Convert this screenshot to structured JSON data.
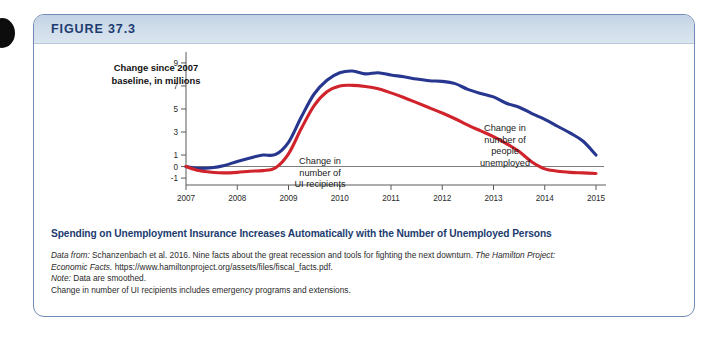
{
  "figure": {
    "label": "FIGURE 37.3",
    "caption": "Spending on Unemployment Insurance Increases Automatically with the Number of Unemployed Persons"
  },
  "notes": {
    "data_from_label": "Data from:",
    "data_from_text": " Schanzenbach et al. 2016. Nine facts about the great recession and tools for fighting the next downturn. ",
    "source_title": "The Hamilton Project:",
    "source_title_2": "Economic Facts.",
    "source_url": " https://www.hamiltonproject.org/assets/files/fiscal_facts.pdf.",
    "note_label": "Note:",
    "note_text": " Data are smoothed.",
    "note_line2": "Change in number of UI recipients includes emergency programs and extensions."
  },
  "colors": {
    "unemployed_series": "#27378f",
    "ui_series": "#d0232b",
    "header_blue": "#cfdcea",
    "caption_blue": "#1c3c70",
    "border_blue": "#6f8cb4"
  },
  "chart_data": {
    "type": "line",
    "title": "",
    "xlabel": "",
    "ylabel": "Change since 2007 baseline, in millions",
    "xlim": [
      2007,
      2015
    ],
    "ylim": [
      -1.6,
      9.6
    ],
    "yticks": [
      9,
      7,
      5,
      3,
      1,
      0,
      -1
    ],
    "ytick_labels": [
      "9",
      "7",
      "5",
      "3",
      "1",
      "0",
      "-1"
    ],
    "xticks": [
      2007,
      2008,
      2009,
      2010,
      2011,
      2012,
      2013,
      2014,
      2015
    ],
    "xtick_labels": [
      "2007",
      "2008",
      "2009",
      "2010",
      "2011",
      "2012",
      "2013",
      "2014",
      "2015"
    ],
    "grid": false,
    "legend_position": "inline-annotations",
    "zero_line": 0,
    "annotations": [
      {
        "name": "ui-recipients-label",
        "text": "Change in\nnumber of\nUI recipients",
        "line1": "Change in",
        "line2": "number of",
        "line3": "UI recipients"
      },
      {
        "name": "people-unemployed-label",
        "text": "Change in\nnumber of\npeople\nunemployed",
        "line1": "Change in",
        "line2": "number of",
        "line3": "people",
        "line4": "unemployed"
      }
    ],
    "x": [
      2007.0,
      2007.25,
      2007.5,
      2007.75,
      2008.0,
      2008.25,
      2008.5,
      2008.75,
      2009.0,
      2009.25,
      2009.5,
      2009.75,
      2010.0,
      2010.25,
      2010.5,
      2010.75,
      2011.0,
      2011.25,
      2011.5,
      2011.75,
      2012.0,
      2012.25,
      2012.5,
      2012.75,
      2013.0,
      2013.25,
      2013.5,
      2013.75,
      2014.0,
      2014.25,
      2014.5,
      2014.75,
      2015.0
    ],
    "series": [
      {
        "name": "Change in number of people unemployed",
        "color": "#27378f",
        "values": [
          0.0,
          -0.15,
          -0.1,
          0.1,
          0.45,
          0.75,
          1.0,
          1.05,
          2.1,
          4.3,
          6.3,
          7.5,
          8.15,
          8.3,
          8.05,
          8.15,
          7.95,
          7.8,
          7.6,
          7.45,
          7.4,
          7.2,
          6.7,
          6.35,
          6.05,
          5.5,
          5.15,
          4.6,
          4.1,
          3.5,
          2.9,
          2.2,
          1.0
        ]
      },
      {
        "name": "Change in number of UI recipients",
        "color": "#d0232b",
        "values": [
          0.0,
          -0.35,
          -0.5,
          -0.55,
          -0.5,
          -0.4,
          -0.35,
          -0.1,
          1.1,
          3.3,
          5.3,
          6.5,
          7.0,
          7.05,
          6.95,
          6.75,
          6.4,
          6.0,
          5.55,
          5.1,
          4.65,
          4.15,
          3.6,
          3.1,
          2.6,
          2.0,
          1.3,
          0.4,
          -0.2,
          -0.4,
          -0.5,
          -0.55,
          -0.6
        ]
      }
    ]
  }
}
